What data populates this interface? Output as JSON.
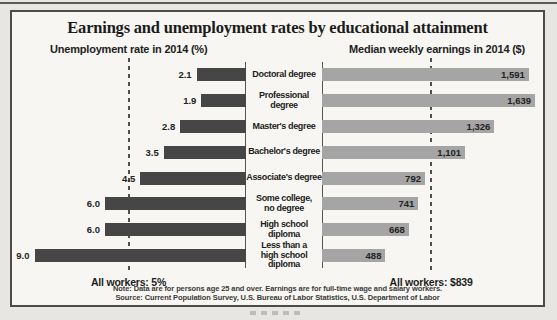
{
  "page": {
    "title": "Earnings and unemployment rates by educational attainment",
    "left_axis_header": "Unemployment rate in 2014 (%)",
    "right_axis_header": "Median weekly earnings in 2014 ($)",
    "note_line1": "Note: Data are for persons age 25 and over. Earnings are for full-time wage and salary workers.",
    "note_line2": "Source: Current Population Survey, U.S. Bureau of Labor Statistics, U.S. Department of Labor"
  },
  "colors": {
    "left_bar": "#464646",
    "right_bar": "#a5a5a5",
    "paper": "#e7e6e2",
    "box_background": "#f7f6f2",
    "box_border": "#4d4c4a",
    "text": "#1d1d1d"
  },
  "chart_data": {
    "type": "bar",
    "orientation": "horizontal-bidirectional",
    "title": "Earnings and unemployment rates by educational attainment",
    "categories": [
      "Doctoral degree",
      "Professional degree",
      "Master's degree",
      "Bachelor's degree",
      "Associate's degree",
      "Some college,\nno degree",
      "High school diploma",
      "Less than a\nhigh school diploma"
    ],
    "series": [
      {
        "name": "Unemployment rate in 2014 (%)",
        "side": "left",
        "values": [
          2.1,
          1.9,
          2.8,
          3.5,
          4.5,
          6.0,
          6.0,
          9.0
        ],
        "value_labels": [
          "2.1",
          "1.9",
          "2.8",
          "3.5",
          "4.5",
          "6.0",
          "6.0",
          "9.0"
        ],
        "axis_range": [
          0,
          9.5
        ],
        "reference_line": {
          "value": 5,
          "label": "All workers: 5%"
        }
      },
      {
        "name": "Median weekly earnings in 2014 ($)",
        "side": "right",
        "values": [
          1591,
          1639,
          1326,
          1101,
          792,
          741,
          668,
          488
        ],
        "value_labels": [
          "1,591",
          "1,639",
          "1,326",
          "1,101",
          "792",
          "741",
          "668",
          "488"
        ],
        "axis_range": [
          0,
          1700
        ],
        "reference_line": {
          "value": 839,
          "label": "All workers: $839"
        }
      }
    ],
    "grid": false,
    "legend": false,
    "note": "Note: Data are for persons age 25 and over. Earnings are for full-time wage and salary workers. Source: Current Population Survey, U.S. Bureau of Labor Statistics, U.S. Department of Labor"
  }
}
